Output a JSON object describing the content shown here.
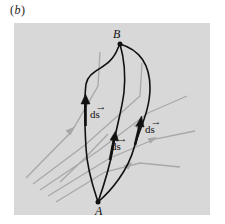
{
  "figure": {
    "label_open": "(",
    "label_letter": "b",
    "label_close": ")"
  },
  "colors": {
    "panel_background": "#d8d8d8",
    "field_line": "#a0a0a0",
    "path_line": "#111111",
    "page_background": "#ffffff"
  },
  "points": {
    "start": {
      "label": "A"
    },
    "end": {
      "label": "B"
    }
  },
  "field_lines": {
    "count": 7,
    "description": "Gray field lines with arrowheads crossing the panel diagonally from lower-left toward upper-right"
  },
  "paths": [
    {
      "name": "left-path",
      "vector_label": "ds",
      "vector_symbol": "→"
    },
    {
      "name": "middle-path",
      "vector_label": "ds",
      "vector_symbol": "→"
    },
    {
      "name": "right-path",
      "vector_label": "ds",
      "vector_symbol": "→"
    }
  ]
}
